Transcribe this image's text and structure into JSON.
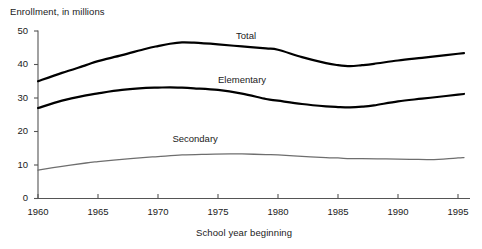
{
  "chart_data": {
    "type": "line",
    "title": "",
    "ylabel": "Enrollment, in millions",
    "xlabel": "School year beginning",
    "xlim": [
      1960,
      1995.5
    ],
    "ylim": [
      0,
      50
    ],
    "grid": false,
    "legend_position": "inline-right-of-curve",
    "xticks": [
      1960,
      1965,
      1970,
      1975,
      1980,
      1985,
      1990,
      1995
    ],
    "xtick_labels": [
      "1960",
      "1965",
      "1970",
      "1975",
      "1980",
      "1985",
      "1990",
      "1995"
    ],
    "yticks": [
      0,
      10,
      20,
      30,
      40,
      50
    ],
    "ytick_labels": [
      "0",
      "10",
      "20",
      "30",
      "40",
      "50"
    ],
    "series": [
      {
        "name": "Total",
        "color": "#000000",
        "width": 2.2,
        "label_x": 1976.5,
        "label_y": 48.5,
        "x": [
          1960,
          1962,
          1964,
          1965,
          1967,
          1969,
          1970,
          1971,
          1972,
          1973,
          1975,
          1977,
          1979,
          1980,
          1982,
          1984,
          1985,
          1986,
          1987,
          1988,
          1990,
          1992,
          1994,
          1995,
          1995.5
        ],
        "values": [
          35.0,
          37.5,
          39.8,
          41.0,
          42.8,
          44.7,
          45.5,
          46.2,
          46.6,
          46.5,
          46.0,
          45.4,
          44.8,
          44.4,
          42.2,
          40.4,
          39.8,
          39.5,
          39.8,
          40.2,
          41.2,
          42.0,
          42.8,
          43.2,
          43.4
        ]
      },
      {
        "name": "Elementary",
        "color": "#000000",
        "width": 2.2,
        "label_x": 1975.0,
        "label_y": 35.2,
        "x": [
          1960,
          1962,
          1964,
          1965,
          1967,
          1969,
          1970,
          1971,
          1972,
          1973,
          1975,
          1977,
          1979,
          1980,
          1982,
          1984,
          1985,
          1986,
          1987,
          1988,
          1990,
          1992,
          1994,
          1995,
          1995.5
        ],
        "values": [
          27.0,
          29.2,
          30.8,
          31.4,
          32.4,
          33.0,
          33.1,
          33.2,
          33.1,
          32.9,
          32.4,
          31.3,
          29.7,
          29.2,
          28.2,
          27.5,
          27.3,
          27.2,
          27.4,
          27.8,
          29.0,
          29.8,
          30.6,
          31.0,
          31.2
        ]
      },
      {
        "name": "Secondary",
        "color": "#6e6e6e",
        "width": 1.3,
        "label_x": 1971.2,
        "label_y": 17.5,
        "x": [
          1960,
          1962,
          1964,
          1965,
          1967,
          1969,
          1970,
          1972,
          1974,
          1976,
          1977,
          1979,
          1980,
          1982,
          1984,
          1985,
          1986,
          1987,
          1989,
          1991,
          1993,
          1994,
          1995,
          1995.5
        ],
        "values": [
          8.5,
          9.6,
          10.6,
          11.0,
          11.7,
          12.3,
          12.5,
          13.0,
          13.2,
          13.3,
          13.3,
          13.1,
          13.0,
          12.6,
          12.2,
          12.1,
          11.9,
          11.9,
          11.8,
          11.7,
          11.6,
          11.8,
          12.1,
          12.2
        ]
      }
    ]
  },
  "labels": {
    "y_axis_title": "Enrollment, in millions",
    "x_axis_title": "School year beginning",
    "series_names": [
      "Total",
      "Elementary",
      "Secondary"
    ]
  }
}
